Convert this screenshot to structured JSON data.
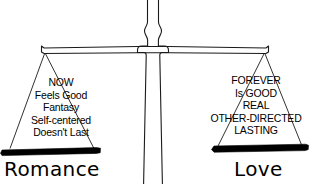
{
  "diagram": {
    "title_alt": "balance scale comparing Romance and Love",
    "colors": {
      "ink": "#1a1a1a",
      "pan_fill": "#000000",
      "background": "#ffffff"
    },
    "left_pan": {
      "label": "Romance",
      "items": [
        "NOW",
        "Feels Good",
        "Fantasy",
        "Self-centered",
        "Doesn't Last"
      ]
    },
    "right_pan": {
      "label": "Love",
      "items": [
        "FOREVER",
        "Is GOOD",
        "REAL",
        "OTHER-DIRECTED",
        "LASTING"
      ]
    }
  }
}
